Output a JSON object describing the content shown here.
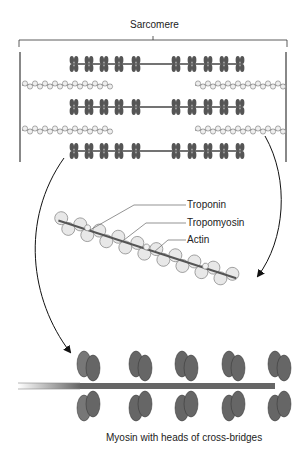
{
  "title": "Sarcomere",
  "labels": {
    "troponin": "Troponin",
    "tropomyosin": "Tropomyosin",
    "actin": "Actin",
    "myosin": "Myosin with heads of cross-bridges"
  },
  "colors": {
    "myosin": "#555555",
    "myosin_light": "#7a7a7a",
    "actin_bead": "#e6e6e6",
    "actin_outline": "#777777",
    "z_line": "#888888",
    "line": "#222222"
  }
}
